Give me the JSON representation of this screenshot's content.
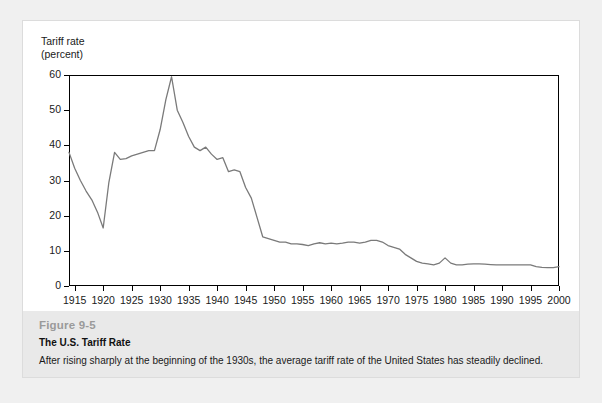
{
  "figure": {
    "number": "Figure 9-5",
    "title": "The U.S. Tariff Rate",
    "description": "After rising sharply at the beginning of the 1930s, the average tariff rate of the United States has steadily declined."
  },
  "chart_data": {
    "type": "line",
    "title": "The U.S. Tariff Rate",
    "xlabel": "",
    "ylabel": "Tariff rate (percent)",
    "ylabel_line1": "Tariff rate",
    "ylabel_line2": "(percent)",
    "xlim": [
      1914,
      2000
    ],
    "ylim": [
      0,
      60
    ],
    "yticks": [
      0,
      10,
      20,
      30,
      40,
      50,
      60
    ],
    "xticks": [
      1915,
      1920,
      1925,
      1930,
      1935,
      1940,
      1945,
      1950,
      1955,
      1960,
      1965,
      1970,
      1975,
      1980,
      1985,
      1990,
      1995,
      2000
    ],
    "grid": false,
    "legend": false,
    "line_color": "#7a7a7a",
    "frame_color": "#000000",
    "series": [
      {
        "name": "Average U.S. tariff rate",
        "x": [
          1914,
          1915,
          1916,
          1917,
          1918,
          1919,
          1920,
          1921,
          1922,
          1923,
          1924,
          1925,
          1926,
          1927,
          1928,
          1929,
          1930,
          1931,
          1932,
          1933,
          1934,
          1935,
          1936,
          1937,
          1938,
          1939,
          1940,
          1941,
          1942,
          1943,
          1944,
          1945,
          1946,
          1947,
          1948,
          1949,
          1950,
          1951,
          1952,
          1953,
          1954,
          1955,
          1956,
          1957,
          1958,
          1959,
          1960,
          1961,
          1962,
          1963,
          1964,
          1965,
          1966,
          1967,
          1968,
          1969,
          1970,
          1971,
          1972,
          1973,
          1974,
          1975,
          1976,
          1977,
          1978,
          1979,
          1980,
          1981,
          1982,
          1983,
          1984,
          1985,
          1986,
          1987,
          1988,
          1989,
          1990,
          1991,
          1992,
          1993,
          1994,
          1995,
          1996,
          1997,
          1998,
          1999,
          2000
        ],
        "values": [
          38.0,
          33.5,
          30.0,
          27.0,
          24.5,
          21.0,
          16.5,
          29.5,
          38.0,
          36.0,
          36.2,
          37.0,
          37.5,
          38.0,
          38.5,
          38.5,
          44.5,
          53.0,
          59.5,
          50.0,
          46.5,
          42.5,
          39.5,
          38.5,
          39.5,
          37.5,
          36.0,
          36.5,
          32.5,
          33.0,
          32.5,
          28.0,
          25.0,
          19.5,
          14.0,
          13.5,
          13.0,
          12.5,
          12.5,
          12.0,
          12.0,
          11.8,
          11.5,
          12.0,
          12.3,
          12.0,
          12.2,
          12.0,
          12.2,
          12.5,
          12.5,
          12.2,
          12.5,
          13.0,
          13.0,
          12.5,
          11.5,
          11.0,
          10.5,
          9.0,
          8.0,
          7.0,
          6.5,
          6.3,
          6.0,
          6.5,
          8.0,
          6.5,
          6.0,
          6.0,
          6.2,
          6.3,
          6.3,
          6.2,
          6.1,
          6.0,
          6.0,
          6.0,
          6.0,
          6.0,
          6.0,
          6.0,
          5.5,
          5.3,
          5.2,
          5.2,
          5.5
        ]
      }
    ]
  }
}
